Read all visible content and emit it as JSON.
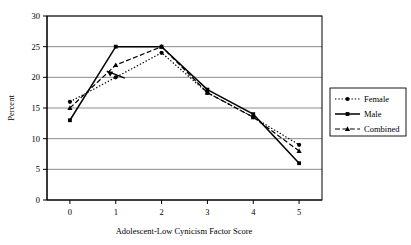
{
  "chart_data": {
    "type": "line",
    "title": "",
    "xlabel": "Adolescent-Low Cynicism Factor Score",
    "ylabel": "Percent",
    "categories": [
      "0",
      "1",
      "2",
      "3",
      "4",
      "5"
    ],
    "xlim": [
      0,
      5
    ],
    "ylim": [
      0,
      30
    ],
    "ytick_labels": [
      "0",
      "5",
      "10",
      "15",
      "20",
      "25",
      "30"
    ],
    "ytick_values": [
      0,
      5,
      10,
      15,
      20,
      25,
      30
    ],
    "xtick_labels": [
      "0",
      "1",
      "2",
      "3",
      "4",
      "5"
    ],
    "grid": "horizontal",
    "legend_position": "right-outside",
    "series": [
      {
        "name": "Female",
        "values": [
          16,
          20,
          24,
          17.5,
          13.5,
          9
        ],
        "marker": "circle",
        "line_style": "dotted",
        "color": "#000000"
      },
      {
        "name": "Male",
        "values": [
          13,
          25,
          25,
          18,
          14,
          6
        ],
        "marker": "square",
        "line_style": "solid",
        "color": "#000000"
      },
      {
        "name": "Combined",
        "values": [
          15,
          22,
          25,
          17.5,
          13.5,
          8
        ],
        "marker": "triangle",
        "line_style": "dashed",
        "color": "#000000"
      }
    ],
    "annotations": [
      {
        "name": "arrow-annotation",
        "x": 1,
        "y": 22,
        "direction": "left"
      }
    ]
  },
  "colors": {
    "plot_border": "#000000",
    "gridline": "#7f7f7f",
    "series": "#000000",
    "legend_border": "#000000",
    "background": "#ffffff"
  }
}
